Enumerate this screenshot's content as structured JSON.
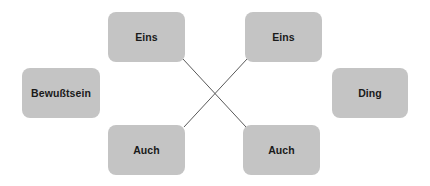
{
  "canvas": {
    "width": 430,
    "height": 186,
    "background_color": "#ffffff"
  },
  "style": {
    "node_fill_color": "#c4c4c4",
    "node_text_color": "#1a1a1a",
    "connector_color": "#595959",
    "node_corner_radius": 8
  },
  "nodes": [
    {
      "id": "bewusstsein",
      "label": "Bewußtsein",
      "x": 22,
      "y": 68,
      "width": 78,
      "height": 50
    },
    {
      "id": "eins-left",
      "label": "Eins",
      "x": 108,
      "y": 12,
      "width": 77,
      "height": 50
    },
    {
      "id": "eins-right",
      "label": "Eins",
      "x": 245,
      "y": 12,
      "width": 77,
      "height": 50
    },
    {
      "id": "auch-left",
      "label": "Auch",
      "x": 108,
      "y": 125,
      "width": 77,
      "height": 50
    },
    {
      "id": "auch-right",
      "label": "Auch",
      "x": 243,
      "y": 125,
      "width": 77,
      "height": 50
    },
    {
      "id": "ding",
      "label": "Ding",
      "x": 332,
      "y": 68,
      "width": 76,
      "height": 50
    }
  ],
  "connectors": [
    {
      "id": "eins-left-to-auch-right",
      "from": "eins-left",
      "to": "auch-right",
      "x1": 183,
      "y1": 59,
      "x2": 246,
      "y2": 127
    },
    {
      "id": "eins-right-to-auch-left",
      "from": "eins-right",
      "to": "auch-left",
      "x1": 247,
      "y1": 59,
      "x2": 184,
      "y2": 127
    }
  ]
}
